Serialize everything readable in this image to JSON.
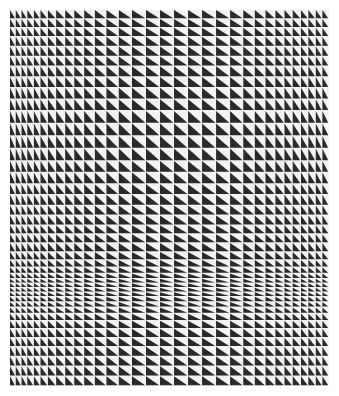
{
  "artwork": {
    "description": "Op-art grid of right triangles, dark lower-left halves on light cells, with varying column widths and row heights",
    "colors": {
      "dark": "#2a2a2a",
      "light": "#f2f2f2",
      "background": "#ffffff"
    },
    "grid": {
      "x": 10,
      "y": 10,
      "width": 319,
      "height": 376,
      "column_weights": [
        7,
        7,
        7,
        8,
        8,
        9,
        10,
        11,
        11,
        12,
        13,
        14,
        15,
        16,
        17,
        17,
        17,
        17,
        17,
        17,
        17,
        16,
        14,
        13,
        12,
        11,
        10,
        10,
        9,
        9,
        8,
        8
      ],
      "row_weights": [
        10,
        10,
        10,
        11,
        11,
        11,
        12,
        12,
        13,
        13,
        14,
        14,
        14,
        14,
        13,
        13,
        12,
        12,
        11,
        11,
        10,
        10,
        10,
        9,
        8,
        7,
        6,
        5,
        5,
        5,
        5,
        6,
        6,
        7,
        8,
        9,
        10,
        10,
        11,
        11,
        11,
        11
      ]
    }
  }
}
